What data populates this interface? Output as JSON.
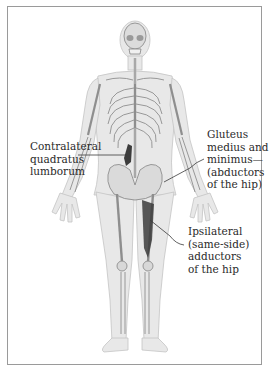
{
  "figure": {
    "colors": {
      "border": "#9a9a9a",
      "body_fill": "#e6e6e6",
      "bone": "#d2d2d2",
      "bone_line": "#8c8c8c",
      "muscle": "#3c3c3c",
      "leader_line": "#3a3a3a",
      "text": "#2a2a2a"
    }
  },
  "labels": [
    {
      "id": "contralateral-quadratus-lumborum",
      "lines": [
        "Contralateral",
        "quadratus",
        "lumborum"
      ]
    },
    {
      "id": "gluteus-medius-minimus",
      "lines": [
        "Gluteus",
        "medius and",
        "minimus—",
        "(abductors",
        "of the hip)"
      ]
    },
    {
      "id": "ipsilateral-adductors",
      "lines": [
        "Ipsilateral",
        "(same-side)",
        "adductors",
        "of the hip"
      ]
    }
  ]
}
